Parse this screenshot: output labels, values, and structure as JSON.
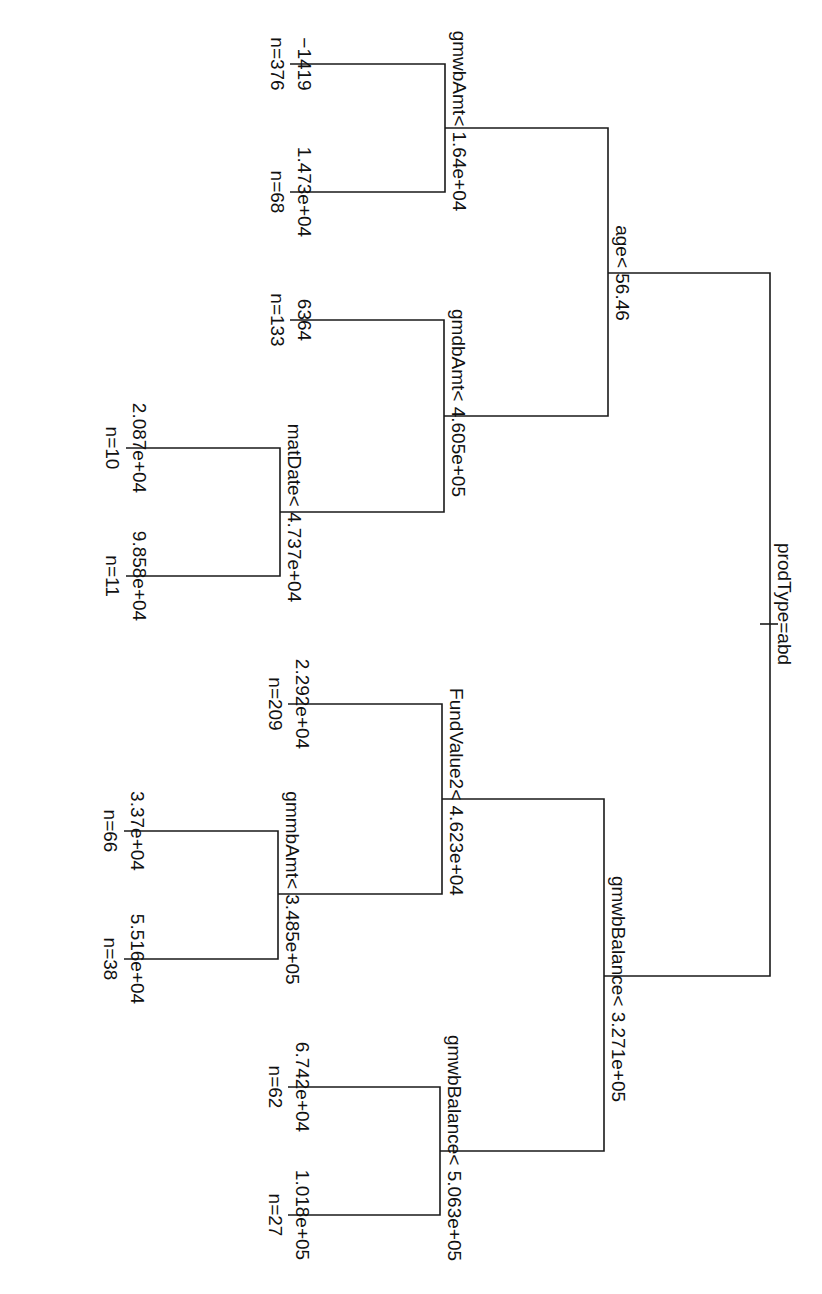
{
  "diagram": {
    "type": "regression-tree",
    "orientation": "rotated-90-clockwise",
    "colors": {
      "line": "#1a1a1a",
      "text": "#111111",
      "background": "#ffffff"
    },
    "root": {
      "split": "prodType=abd",
      "left": {
        "split": "age< 56.46",
        "left": {
          "split": "gmwbAmt< 1.64e+04",
          "left": {
            "value": "−1419",
            "n": "n=376"
          },
          "right": {
            "value": "1.473e+04",
            "n": "n=68"
          }
        },
        "right": {
          "split": "gmdbAmt< 4.605e+05",
          "left": {
            "value": "6364",
            "n": "n=133"
          },
          "right": {
            "split": "matDate< 4.737e+04",
            "left": {
              "value": "2.087e+04",
              "n": "n=10"
            },
            "right": {
              "value": "9.858e+04",
              "n": "n=11"
            }
          }
        }
      },
      "right": {
        "split": "gmwbBalance< 3.271e+05",
        "left": {
          "split": "FundValue2< 4.623e+04",
          "left": {
            "value": "2.292e+04",
            "n": "n=209"
          },
          "right": {
            "split": "gmmbAmt< 3.485e+05",
            "left": {
              "value": "3.37e+04",
              "n": "n=66"
            },
            "right": {
              "value": "5.516e+04",
              "n": "n=38"
            }
          }
        },
        "right": {
          "split": "gmwbBalance< 5.063e+05",
          "left": {
            "value": "6.742e+04",
            "n": "n=62"
          },
          "right": {
            "value": "1.018e+05",
            "n": "n=27"
          }
        }
      }
    }
  }
}
